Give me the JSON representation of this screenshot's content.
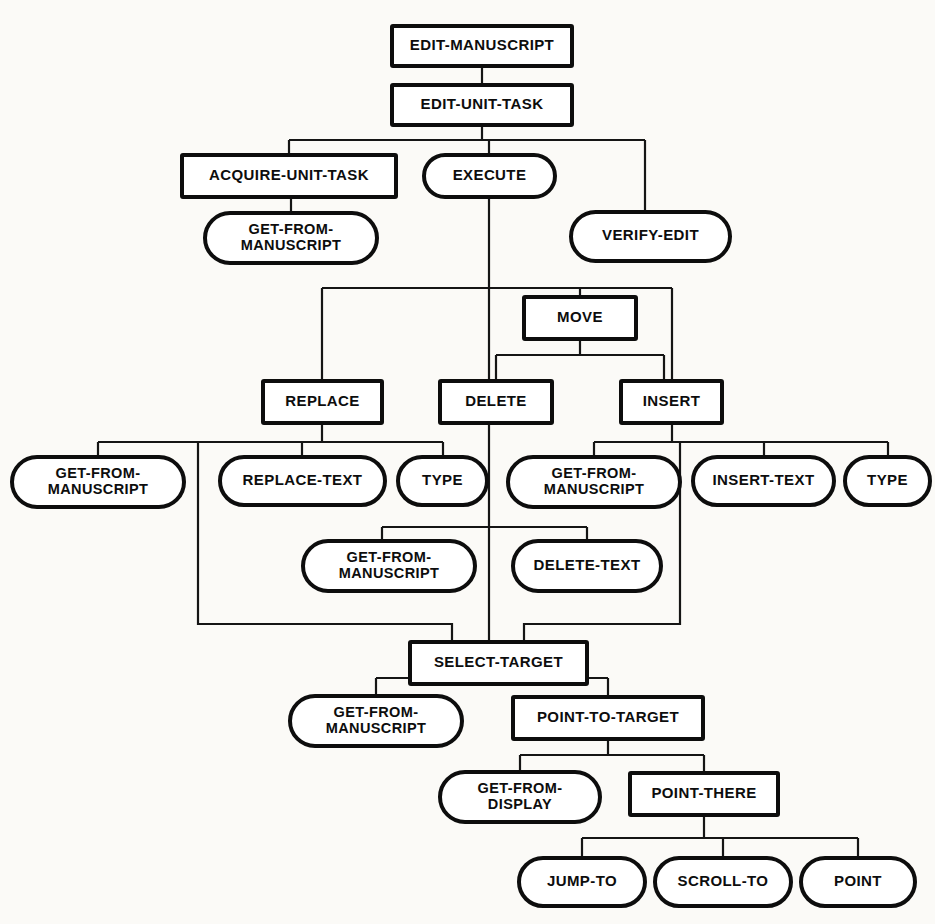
{
  "diagram": {
    "type": "hierarchical-task-tree",
    "background_color": "#fbfaf7",
    "line_color": "#151515",
    "node_fill": "#ffffff",
    "node_stroke": "#0d0d0d",
    "shape_legend": {
      "rectangle": "goal / unit task (non-terminal)",
      "stadium": "operator / terminal method"
    },
    "nodes": [
      {
        "id": "edit-manuscript",
        "label": "EDIT-MANUSCRIPT",
        "shape": "rect",
        "x": 392,
        "y": 26,
        "w": 180,
        "h": 40,
        "lines": [
          "EDIT-MANUSCRIPT"
        ]
      },
      {
        "id": "edit-unit-task",
        "label": "EDIT-UNIT-TASK",
        "shape": "rect",
        "x": 392,
        "y": 85,
        "w": 180,
        "h": 40,
        "lines": [
          "EDIT-UNIT-TASK"
        ]
      },
      {
        "id": "acquire-unit-task",
        "label": "ACQUIRE-UNIT-TASK",
        "shape": "rect",
        "x": 182,
        "y": 155,
        "w": 214,
        "h": 42,
        "lines": [
          "ACQUIRE-UNIT-TASK"
        ]
      },
      {
        "id": "execute",
        "label": "EXECUTE",
        "shape": "stadium",
        "x": 424,
        "y": 155,
        "w": 131,
        "h": 42,
        "lines": [
          "EXECUTE"
        ]
      },
      {
        "id": "get-from-manuscript-1",
        "label": "GET-FROM-MANUSCRIPT",
        "shape": "stadium",
        "x": 205,
        "y": 213,
        "w": 172,
        "h": 50,
        "lines": [
          "GET-FROM-",
          "MANUSCRIPT"
        ]
      },
      {
        "id": "verify-edit",
        "label": "VERIFY-EDIT",
        "shape": "stadium",
        "x": 571,
        "y": 212,
        "w": 159,
        "h": 49,
        "lines": [
          "VERIFY-EDIT"
        ]
      },
      {
        "id": "move",
        "label": "MOVE",
        "shape": "rect",
        "x": 524,
        "y": 297,
        "w": 112,
        "h": 42,
        "lines": [
          "MOVE"
        ]
      },
      {
        "id": "replace",
        "label": "REPLACE",
        "shape": "rect",
        "x": 263,
        "y": 381,
        "w": 119,
        "h": 42,
        "lines": [
          "REPLACE"
        ]
      },
      {
        "id": "delete",
        "label": "DELETE",
        "shape": "rect",
        "x": 440,
        "y": 381,
        "w": 112,
        "h": 42,
        "lines": [
          "DELETE"
        ]
      },
      {
        "id": "insert",
        "label": "INSERT",
        "shape": "rect",
        "x": 621,
        "y": 381,
        "w": 101,
        "h": 42,
        "lines": [
          "INSERT"
        ]
      },
      {
        "id": "get-from-manuscript-2",
        "label": "GET-FROM-MANUSCRIPT",
        "shape": "stadium",
        "x": 12,
        "y": 457,
        "w": 172,
        "h": 50,
        "lines": [
          "GET-FROM-",
          "MANUSCRIPT"
        ]
      },
      {
        "id": "replace-text",
        "label": "REPLACE-TEXT",
        "shape": "stadium",
        "x": 220,
        "y": 457,
        "w": 165,
        "h": 48,
        "lines": [
          "REPLACE-TEXT"
        ]
      },
      {
        "id": "type-1",
        "label": "TYPE",
        "shape": "stadium",
        "x": 398,
        "y": 457,
        "w": 89,
        "h": 48,
        "lines": [
          "TYPE"
        ]
      },
      {
        "id": "get-from-manuscript-3",
        "label": "GET-FROM-MANUSCRIPT",
        "shape": "stadium",
        "x": 508,
        "y": 457,
        "w": 172,
        "h": 50,
        "lines": [
          "GET-FROM-",
          "MANUSCRIPT"
        ]
      },
      {
        "id": "insert-text",
        "label": "INSERT-TEXT",
        "shape": "stadium",
        "x": 693,
        "y": 457,
        "w": 141,
        "h": 48,
        "lines": [
          "INSERT-TEXT"
        ]
      },
      {
        "id": "type-2",
        "label": "TYPE",
        "shape": "stadium",
        "x": 845,
        "y": 457,
        "w": 85,
        "h": 48,
        "lines": [
          "TYPE"
        ]
      },
      {
        "id": "get-from-manuscript-4",
        "label": "GET-FROM-MANUSCRIPT",
        "shape": "stadium",
        "x": 303,
        "y": 541,
        "w": 172,
        "h": 50,
        "lines": [
          "GET-FROM-",
          "MANUSCRIPT"
        ]
      },
      {
        "id": "delete-text",
        "label": "DELETE-TEXT",
        "shape": "stadium",
        "x": 513,
        "y": 541,
        "w": 148,
        "h": 50,
        "lines": [
          "DELETE-TEXT"
        ]
      },
      {
        "id": "select-target",
        "label": "SELECT-TARGET",
        "shape": "rect",
        "x": 410,
        "y": 642,
        "w": 177,
        "h": 42,
        "lines": [
          "SELECT-TARGET"
        ]
      },
      {
        "id": "get-from-manuscript-5",
        "label": "GET-FROM-MANUSCRIPT",
        "shape": "stadium",
        "x": 290,
        "y": 696,
        "w": 172,
        "h": 50,
        "lines": [
          "GET-FROM-",
          "MANUSCRIPT"
        ]
      },
      {
        "id": "point-to-target",
        "label": "POINT-TO-TARGET",
        "shape": "rect",
        "x": 513,
        "y": 697,
        "w": 190,
        "h": 42,
        "lines": [
          "POINT-TO-TARGET"
        ]
      },
      {
        "id": "get-from-display",
        "label": "GET-FROM-DISPLAY",
        "shape": "stadium",
        "x": 440,
        "y": 772,
        "w": 160,
        "h": 50,
        "lines": [
          "GET-FROM-",
          "DISPLAY"
        ]
      },
      {
        "id": "point-there",
        "label": "POINT-THERE",
        "shape": "rect",
        "x": 630,
        "y": 773,
        "w": 148,
        "h": 42,
        "lines": [
          "POINT-THERE"
        ]
      },
      {
        "id": "jump-to",
        "label": "JUMP-TO",
        "shape": "stadium",
        "x": 519,
        "y": 858,
        "w": 126,
        "h": 48,
        "lines": [
          "JUMP-TO"
        ]
      },
      {
        "id": "scroll-to",
        "label": "SCROLL-TO",
        "shape": "stadium",
        "x": 655,
        "y": 858,
        "w": 136,
        "h": 48,
        "lines": [
          "SCROLL-TO"
        ]
      },
      {
        "id": "point",
        "label": "POINT",
        "shape": "stadium",
        "x": 801,
        "y": 858,
        "w": 114,
        "h": 48,
        "lines": [
          "POINT"
        ]
      }
    ],
    "edges": [
      {
        "id": "e-em-eut",
        "from": "edit-manuscript",
        "to": "edit-unit-task",
        "path": "M 482,66 L 482,85"
      },
      {
        "id": "e-eut-bus",
        "from": "edit-unit-task",
        "to": "level2-bus",
        "path": "M 482,125 L 482,140 M 289,140 L 645,140 M 289,140 L 289,155 M 489,140 L 489,155 M 645,140 L 645,212"
      },
      {
        "id": "e-aut-gfm",
        "from": "acquire-unit-task",
        "to": "get-from-manuscript-1",
        "path": "M 291,197 L 291,213"
      },
      {
        "id": "e-exec-down",
        "from": "execute",
        "to": "level3-bus",
        "path": "M 489,197 L 489,288"
      },
      {
        "id": "e-lvl3-bus",
        "from": "level3-bus",
        "to": "replace-delete-insert",
        "path": "M 322,288 L 672,288 M 322,288 L 322,381 M 672,288 L 672,381 M 580,288 L 580,297"
      },
      {
        "id": "e-exec-cont",
        "from": "execute",
        "to": "delete",
        "path": "M 489,288 L 489,381"
      },
      {
        "id": "e-move-bus",
        "from": "move",
        "to": "delete-insert",
        "path": "M 580,339 L 580,355 M 496,355 L 664,355 M 496,355 L 496,381 M 664,355 L 664,381"
      },
      {
        "id": "e-rep-bus",
        "from": "replace",
        "to": "replace-children",
        "path": "M 322,423 L 322,442 M 98,442 L 443,442 M 98,442 L 98,457 M 302,442 L 302,457 M 443,442 L 443,457"
      },
      {
        "id": "e-ins-bus",
        "from": "insert",
        "to": "insert-children",
        "path": "M 672,423 L 672,442 M 594,442 L 888,442 M 594,442 L 594,457 M 764,442 L 764,457 M 888,442 L 888,457"
      },
      {
        "id": "e-del-bus",
        "from": "delete",
        "to": "delete-children",
        "path": "M 489,423 L 489,527 M 382,527 L 587,527 M 382,527 L 382,541 M 587,527 L 587,541"
      },
      {
        "id": "e-rep-long",
        "from": "replace",
        "to": "select-target",
        "path": "M 198,442 L 198,624 L 452,624 L 452,642"
      },
      {
        "id": "e-del-long",
        "from": "delete",
        "to": "select-target",
        "path": "M 489,527 L 489,642"
      },
      {
        "id": "e-ins-long",
        "from": "insert",
        "to": "select-target",
        "path": "M 680,442 L 680,624 L 524,624 L 524,642"
      },
      {
        "id": "e-st-bus",
        "from": "select-target",
        "to": "select-target-children",
        "path": "M 489,684 L 489,678 M 376,678 L 608,678 M 376,678 L 376,696 M 608,678 L 608,697"
      },
      {
        "id": "e-ptt-bus",
        "from": "point-to-target",
        "to": "point-to-target-kids",
        "path": "M 608,739 L 608,755 M 520,755 L 704,755 M 520,755 L 520,772 M 704,755 L 704,773"
      },
      {
        "id": "e-pt-bus",
        "from": "point-there",
        "to": "point-there-children",
        "path": "M 704,815 L 704,838 M 582,838 L 858,838 M 582,838 L 582,858 M 723,838 L 723,858 M 858,838 L 858,858"
      }
    ]
  }
}
